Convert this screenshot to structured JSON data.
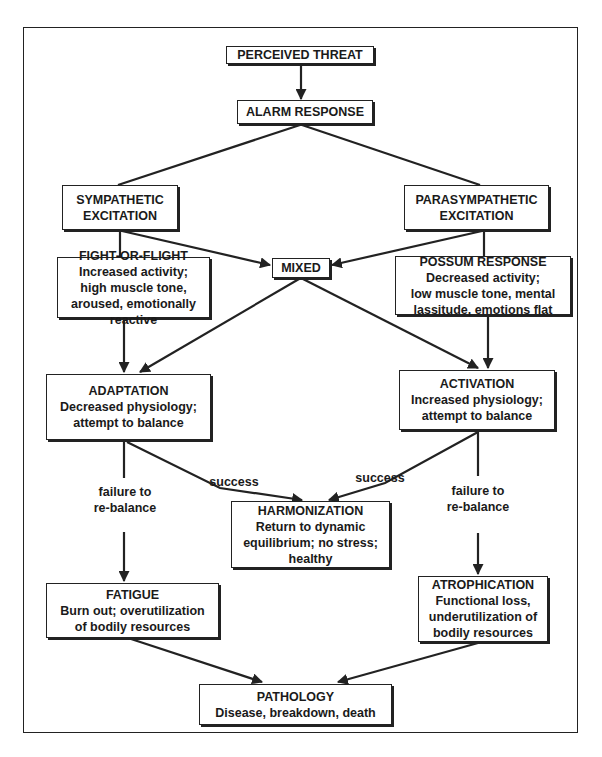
{
  "diagram": {
    "nodes": {
      "perceived_threat": {
        "title": "PERCEIVED THREAT"
      },
      "alarm_response": {
        "title": "ALARM RESPONSE"
      },
      "sympathetic": {
        "title_line1": "SYMPATHETIC",
        "title_line2": "EXCITATION"
      },
      "parasympathetic": {
        "title_line1": "PARASYMPATHETIC",
        "title_line2": "EXCITATION"
      },
      "mixed": {
        "title": "MIXED"
      },
      "fight_or_flight": {
        "title": "FIGHT-OR-FLIGHT",
        "desc": [
          "Increased activity;",
          "high muscle tone,",
          "aroused, emotionally",
          "reactive"
        ]
      },
      "possum_response": {
        "title": "POSSUM RESPONSE",
        "desc": [
          "Decreased activity;",
          "low muscle tone, mental",
          "lassitude, emotions flat"
        ]
      },
      "adaptation": {
        "title": "ADAPTATION",
        "desc": [
          "Decreased physiology;",
          "attempt to balance"
        ]
      },
      "activation": {
        "title": "ACTIVATION",
        "desc": [
          "Increased physiology;",
          "attempt to balance"
        ]
      },
      "harmonization": {
        "title": "HARMONIZATION",
        "desc": [
          "Return to dynamic",
          "equilibrium; no stress;",
          "healthy"
        ]
      },
      "fatigue": {
        "title": "FATIGUE",
        "desc": [
          "Burn out; overutilization",
          "of bodily resources"
        ]
      },
      "atrophication": {
        "title": "ATROPHICATION",
        "desc": [
          "Functional loss,",
          "underutilization of",
          "bodily resources"
        ]
      },
      "pathology": {
        "title": "PATHOLOGY",
        "desc": [
          "Disease, breakdown, death"
        ]
      }
    },
    "edge_labels": {
      "left_success": "success",
      "right_success": "success",
      "left_failure": [
        "failure to",
        "re-balance"
      ],
      "right_failure": [
        "failure to",
        "re-balance"
      ]
    },
    "edges": [
      {
        "from": "PERCEIVED THREAT",
        "to": "ALARM RESPONSE"
      },
      {
        "from": "ALARM RESPONSE",
        "to": "SYMPATHETIC EXCITATION"
      },
      {
        "from": "ALARM RESPONSE",
        "to": "PARASYMPATHETIC EXCITATION"
      },
      {
        "from": "SYMPATHETIC EXCITATION",
        "to": "FIGHT-OR-FLIGHT"
      },
      {
        "from": "SYMPATHETIC EXCITATION",
        "to": "MIXED"
      },
      {
        "from": "PARASYMPATHETIC EXCITATION",
        "to": "POSSUM RESPONSE"
      },
      {
        "from": "PARASYMPATHETIC EXCITATION",
        "to": "MIXED"
      },
      {
        "from": "FIGHT-OR-FLIGHT",
        "to": "ADAPTATION"
      },
      {
        "from": "MIXED",
        "to": "ADAPTATION"
      },
      {
        "from": "MIXED",
        "to": "ACTIVATION"
      },
      {
        "from": "POSSUM RESPONSE",
        "to": "ACTIVATION"
      },
      {
        "from": "ADAPTATION",
        "to": "HARMONIZATION",
        "label": "success"
      },
      {
        "from": "ACTIVATION",
        "to": "HARMONIZATION",
        "label": "success"
      },
      {
        "from": "ADAPTATION",
        "to": "FATIGUE",
        "label": "failure to re-balance"
      },
      {
        "from": "ACTIVATION",
        "to": "ATROPHICATION",
        "label": "failure to re-balance"
      },
      {
        "from": "FATIGUE",
        "to": "PATHOLOGY"
      },
      {
        "from": "ATROPHICATION",
        "to": "PATHOLOGY"
      }
    ],
    "colors": {
      "ink": "#222222",
      "background": "#ffffff"
    }
  }
}
